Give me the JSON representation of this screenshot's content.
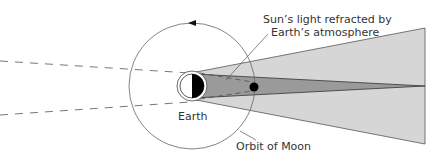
{
  "diagram": {
    "labels": {
      "refracted_line1": "Sun’s light refracted by",
      "refracted_line2": "Earth’s atmosphere",
      "earth": "Earth",
      "orbit": "Orbit of Moon"
    },
    "colors": {
      "penumbra": "#d6d6d6",
      "umbra": "#9a9a9a",
      "earth_night": "#000000",
      "line": "#444444",
      "background": "#ffffff"
    }
  }
}
